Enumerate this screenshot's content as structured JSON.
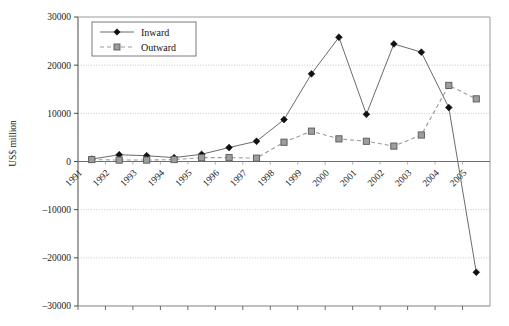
{
  "chart_data": {
    "type": "line",
    "title": "",
    "subtitle": "",
    "xlabel": "",
    "ylabel": "US$ million",
    "categories": [
      "1991",
      "1992",
      "1993",
      "1994",
      "1995",
      "1996",
      "1997",
      "1998",
      "1999",
      "2000",
      "2001",
      "2002",
      "2003",
      "2004",
      "2005"
    ],
    "series": [
      {
        "name": "Inward",
        "marker": "diamond",
        "line_style": "solid",
        "color": "#1a1a1a",
        "values": [
          500,
          1400,
          1200,
          800,
          1500,
          2900,
          4200,
          8700,
          18200,
          25800,
          9800,
          24400,
          22700,
          11200,
          -23000
        ]
      },
      {
        "name": "Outward",
        "marker": "square",
        "line_style": "dashed",
        "color": "#8c8c8c",
        "values": [
          400,
          300,
          300,
          400,
          800,
          800,
          700,
          4000,
          6300,
          4700,
          4200,
          3200,
          5500,
          15800,
          13000
        ]
      }
    ],
    "ylim": [
      -30000,
      30000
    ],
    "ytick_values": [
      30000,
      20000,
      10000,
      0,
      -10000,
      -20000,
      -30000
    ],
    "ytick_labels": [
      "30000",
      "20000",
      "10000",
      "0",
      "–10000",
      "–20000",
      "–30000"
    ],
    "grid": "horizontal-dotted",
    "legend_position": "top-left-inside",
    "legend_entries": [
      "Inward",
      "Outward"
    ]
  }
}
